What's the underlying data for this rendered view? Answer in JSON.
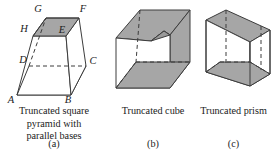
{
  "figures": [
    {
      "id": "truncated-square-pyramid",
      "caption_lines": [
        "Truncated square",
        "pyramid with",
        "parallel bases"
      ],
      "sublabel": "(a)",
      "vertex_labels": [
        {
          "name": "G",
          "x": 38,
          "y": 12
        },
        {
          "name": "F",
          "x": 67,
          "y": 12
        },
        {
          "name": "H",
          "x": 21,
          "y": 32
        },
        {
          "name": "E",
          "x": 57,
          "y": 32
        },
        {
          "name": "D",
          "x": 18,
          "y": 62
        },
        {
          "name": "C",
          "x": 78,
          "y": 62
        },
        {
          "name": "A",
          "x": 9,
          "y": 99
        },
        {
          "name": "B",
          "x": 60,
          "y": 99
        }
      ]
    },
    {
      "id": "truncated-cube",
      "caption_lines": [
        "Truncated cube"
      ],
      "sublabel": "(b)",
      "vertex_labels": []
    },
    {
      "id": "truncated-prism",
      "caption_lines": [
        "Truncated prism"
      ],
      "sublabel": "(c)",
      "vertex_labels": []
    }
  ],
  "colors": {
    "shade_fill": "#a6a6a6",
    "shade_fill_dark": "#9a9a9a",
    "face_light": "#ffffff",
    "stroke": "#3c3c3c",
    "text": "#1b1b1b",
    "background": "#ffffff"
  }
}
